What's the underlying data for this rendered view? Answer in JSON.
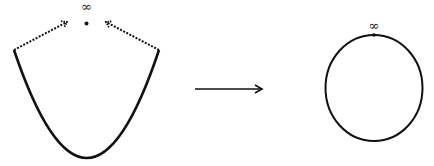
{
  "diagram": {
    "left_figure": {
      "shape": "parabola",
      "point_label": "∞",
      "point": "dot-at-infinity",
      "arrows": [
        "dashed-arrow-left-end-to-infinity",
        "dashed-arrow-right-end-to-infinity"
      ]
    },
    "transform_arrow": "→",
    "right_figure": {
      "shape": "circle",
      "point_label": "∞"
    },
    "colors": {
      "stroke": "#111111",
      "background": "#ffffff"
    }
  }
}
